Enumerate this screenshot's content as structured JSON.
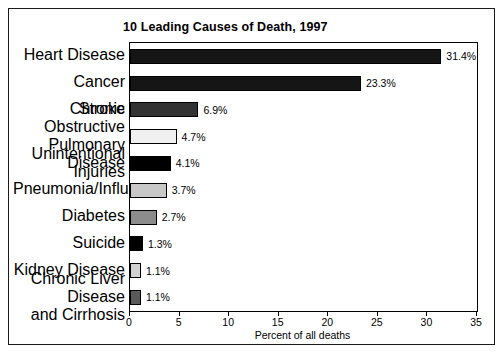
{
  "figure": {
    "title": "10 Leading Causes of Death, 1997"
  },
  "chart_data": {
    "type": "bar",
    "orientation": "horizontal",
    "title": "10 Leading Causes of Death, 1997",
    "xlabel": "Percent of all deaths",
    "ylabel": "",
    "xlim": [
      0,
      35
    ],
    "xticks": [
      0,
      5,
      10,
      15,
      20,
      25,
      30,
      35
    ],
    "xtick_labels": [
      "0",
      "5",
      "10",
      "15",
      "20",
      "25",
      "30",
      "35"
    ],
    "grid": false,
    "legend": false,
    "categories": [
      "Heart Disease",
      "Cancer",
      "Stroke",
      "Chronic Obstructive Pulmonary Disease",
      "Unintentional Injuries",
      "Pneumonia/Influenza",
      "Diabetes",
      "Suicide",
      "Kidney Disease",
      "Chronic Liver Disease and Cirrhosis"
    ],
    "category_lines": [
      [
        "Heart Disease"
      ],
      [
        "Cancer"
      ],
      [
        "Stroke"
      ],
      [
        "Chronic Obstructive",
        "Pulmonary Disease"
      ],
      [
        "Unintentional Injuries"
      ],
      [
        "Pneumonia/Influenza"
      ],
      [
        "Diabetes"
      ],
      [
        "Suicide"
      ],
      [
        "Kidney Disease"
      ],
      [
        "Chronic Liver Disease",
        "and Cirrhosis"
      ]
    ],
    "values": [
      31.4,
      23.3,
      6.9,
      4.7,
      4.1,
      3.7,
      2.7,
      1.3,
      1.1,
      1.1
    ],
    "value_labels": [
      "31.4%",
      "23.3%",
      "6.9%",
      "4.7%",
      "4.1%",
      "3.7%",
      "2.7%",
      "1.3%",
      "1.1%",
      "1.1%"
    ],
    "bar_colors": [
      "#151515",
      "#151515",
      "#333333",
      "#f0f0f0",
      "#000000",
      "#c8c8c8",
      "#8c8c8c",
      "#000000",
      "#d2d2d2",
      "#5a5a5a"
    ],
    "bar_edge_color": "#000000"
  }
}
